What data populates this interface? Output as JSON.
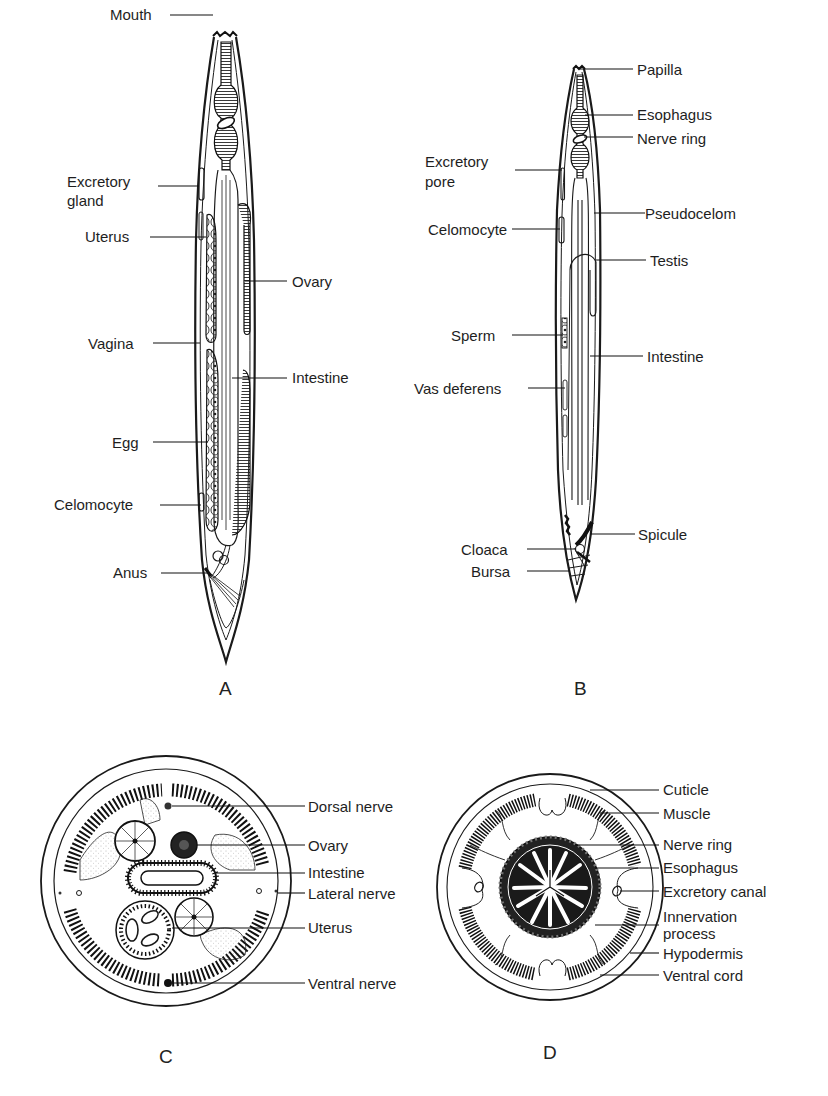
{
  "figure": {
    "panels": [
      {
        "id": "A",
        "letter": "A",
        "description": "Female nematode, longitudinal view",
        "labels": {
          "mouth": "Mouth",
          "excretory_gland_1": "Excretory",
          "excretory_gland_2": "gland",
          "uterus": "Uterus",
          "ovary": "Ovary",
          "vagina": "Vagina",
          "intestine": "Intestine",
          "egg": "Egg",
          "celomocyte": "Celomocyte",
          "anus": "Anus"
        }
      },
      {
        "id": "B",
        "letter": "B",
        "description": "Male nematode, longitudinal view",
        "labels": {
          "papilla": "Papilla",
          "esophagus": "Esophagus",
          "nerve_ring": "Nerve ring",
          "excretory_pore_1": "Excretory",
          "excretory_pore_2": "pore",
          "pseudocelom": "Pseudocelom",
          "celomocyte": "Celomocyte",
          "testis": "Testis",
          "sperm": "Sperm",
          "intestine": "Intestine",
          "vas_deferens": "Vas deferens",
          "spicule": "Spicule",
          "cloaca": "Cloaca",
          "bursa": "Bursa"
        }
      },
      {
        "id": "C",
        "letter": "C",
        "description": "Cross section through female body",
        "labels": {
          "dorsal_nerve": "Dorsal nerve",
          "ovary": "Ovary",
          "intestine": "Intestine",
          "lateral_nerve": "Lateral nerve",
          "uterus": "Uterus",
          "ventral_nerve": "Ventral nerve"
        }
      },
      {
        "id": "D",
        "letter": "D",
        "description": "Cross section through esophageal region",
        "labels": {
          "cuticle": "Cuticle",
          "muscle": "Muscle",
          "nerve_ring": "Nerve ring",
          "esophagus": "Esophagus",
          "excretory_canal": "Excretory canal",
          "innervation_process_1": "Innervation",
          "innervation_process_2": "process",
          "hypodermis": "Hypodermis",
          "ventral_cord": "Ventral cord"
        }
      }
    ]
  }
}
